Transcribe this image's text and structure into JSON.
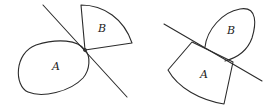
{
  "figures": [
    {
      "id": "left",
      "description": "Convex set B and non-convex region A touching at a single point, separated by a line",
      "line": {
        "x1": 43,
        "y1": 5,
        "x2": 127,
        "y2": 97
      },
      "regions": [
        {
          "label": "A",
          "shape": "loop",
          "label_pos": [
            52,
            67
          ]
        },
        {
          "label": "B",
          "shape": "sector",
          "label_pos": [
            102,
            31
          ]
        }
      ],
      "contact_point": [
        85,
        50
      ]
    },
    {
      "id": "right",
      "description": "Sector A and loop B overlapping across a line",
      "line": {
        "x1": 164,
        "y1": 24,
        "x2": 262,
        "y2": 81
      },
      "regions": [
        {
          "label": "A",
          "shape": "sector",
          "label_pos": [
            204,
            76
          ]
        },
        {
          "label": "B",
          "shape": "loop",
          "label_pos": [
            231,
            33
          ]
        }
      ]
    }
  ],
  "colors": {
    "stroke": "#2b2b2b",
    "background": "#ffffff",
    "text": "#222222"
  }
}
